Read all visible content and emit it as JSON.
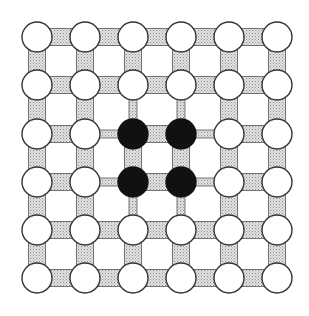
{
  "diagram": {
    "type": "grid-lattice",
    "rows": 6,
    "cols": 6,
    "node_x": [
      37,
      85,
      133,
      181,
      229,
      277
    ],
    "node_y": [
      37,
      85,
      134,
      182,
      230,
      278
    ],
    "node_radius": 15,
    "wide_link_width": 17,
    "narrow_link_width": 8,
    "filled_nodes": [
      [
        2,
        2
      ],
      [
        2,
        3
      ],
      [
        3,
        2
      ],
      [
        3,
        3
      ]
    ],
    "colors": {
      "background": "#ffffff",
      "node_fill": "#ffffff",
      "node_stroke": "#333333",
      "filled_node": "#111111",
      "link_fill": "#cfcfcf",
      "link_stroke": "#555555"
    }
  }
}
